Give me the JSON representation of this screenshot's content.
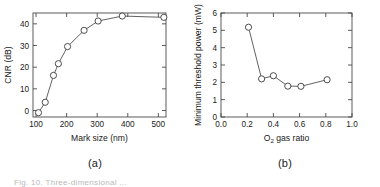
{
  "figure": {
    "panel_a_label": "(a)",
    "panel_b_label": "(b)",
    "caption_fragment": "Fig. 10.   Three-dimensional ..."
  },
  "chart_data": [
    {
      "id": "panel-a",
      "type": "line",
      "title": "",
      "panel_label": "(a)",
      "xlabel": "Mark size (nm)",
      "ylabel": "CNR (dB)",
      "xlim": [
        90,
        525
      ],
      "ylim": [
        -3,
        45
      ],
      "xticks": [
        100,
        200,
        300,
        400,
        500
      ],
      "xtick_labels": [
        "100",
        "200",
        "300",
        "400",
        "500"
      ],
      "yticks": [
        0,
        10,
        20,
        30,
        40
      ],
      "ytick_labels": [
        "0",
        "10",
        "20",
        "30",
        "40"
      ],
      "grid": false,
      "legend": null,
      "marker": "open-circle",
      "x": [
        108,
        130,
        157,
        173,
        203,
        257,
        303,
        382,
        518
      ],
      "y": [
        -1.0,
        3.8,
        16.2,
        21.6,
        29.5,
        37.0,
        41.3,
        43.6,
        43.0
      ]
    },
    {
      "id": "panel-b",
      "type": "line",
      "title": "",
      "panel_label": "(b)",
      "xlabel": "O2 gas ratio",
      "xlabel_base": "O",
      "xlabel_sub": "2",
      "xlabel_rest": " gas ratio",
      "ylabel": "Minimum threshold power (mW)",
      "xlim": [
        0.0,
        1.0
      ],
      "ylim": [
        0,
        6
      ],
      "xticks": [
        0.0,
        0.2,
        0.4,
        0.6,
        0.8,
        1.0
      ],
      "xtick_labels": [
        "0.0",
        "0.2",
        "0.4",
        "0.6",
        "0.8",
        "1.0"
      ],
      "yticks": [
        0,
        1,
        2,
        3,
        4,
        5,
        6
      ],
      "ytick_labels": [
        "0",
        "1",
        "2",
        "3",
        "4",
        "5",
        "6"
      ],
      "grid": false,
      "legend": null,
      "marker": "open-circle",
      "x": [
        0.21,
        0.31,
        0.4,
        0.51,
        0.61,
        0.81
      ],
      "y": [
        5.18,
        2.2,
        2.38,
        1.78,
        1.77,
        2.15
      ]
    }
  ]
}
